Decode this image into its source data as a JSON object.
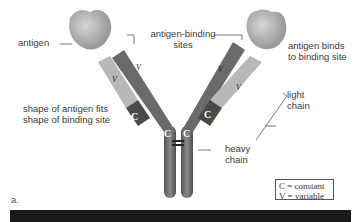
{
  "figure": {
    "panel_label": "a.",
    "labels": {
      "antigen": "antigen",
      "binding_sites_line1": "antigen-binding",
      "binding_sites_line2": "sites",
      "binds_line1": "antigen binds",
      "binds_line2": "to binding site",
      "fits_line1": "shape of antigen fits",
      "fits_line2": "shape of binding site",
      "light_line1": "light",
      "light_line2": "chain",
      "heavy_line1": "heavy",
      "heavy_line2": "chain"
    },
    "domain_letters": {
      "constant": "C",
      "variable": "V"
    },
    "legend": {
      "constant": "C = constant",
      "variable": "V = variable"
    },
    "colors": {
      "heavy_chain": "#6b6b6b",
      "light_chain_variable": "#b5b5b5",
      "light_chain_constant": "#4a4a4a",
      "antigen": "#a9a9a9"
    }
  }
}
